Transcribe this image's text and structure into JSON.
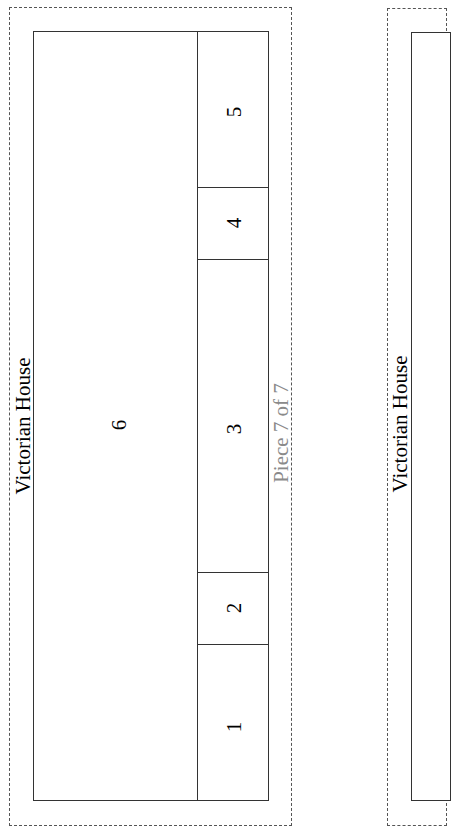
{
  "pieces": [
    {
      "title": "Victorian House",
      "piece_label": "Piece 7 of 7",
      "sections": [
        {
          "id": "1",
          "label": "1"
        },
        {
          "id": "2",
          "label": "2"
        },
        {
          "id": "3",
          "label": "3"
        },
        {
          "id": "4",
          "label": "4"
        },
        {
          "id": "5",
          "label": "5"
        },
        {
          "id": "6",
          "label": "6"
        }
      ]
    },
    {
      "title": "Victorian House"
    }
  ],
  "colors": {
    "line": "#333333",
    "dashed_border": "#555555",
    "piece_label": "#8a8a8a"
  }
}
